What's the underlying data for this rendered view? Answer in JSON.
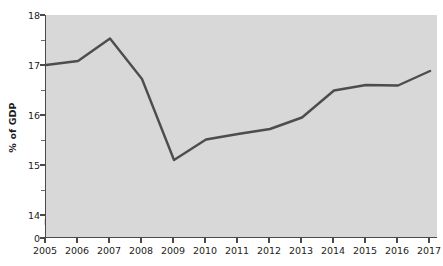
{
  "chart_data": {
    "type": "line",
    "title": "",
    "subtitle": "",
    "xlabel": "",
    "ylabel": "% of GDP",
    "categories": [
      "2005",
      "2006",
      "2007",
      "2008",
      "2009",
      "2010",
      "2011",
      "2012",
      "2013",
      "2014",
      "2015",
      "2016",
      "2017"
    ],
    "x": [
      2005,
      2006,
      2007,
      2008,
      2009,
      2010,
      2011,
      2012,
      2013,
      2014,
      2015,
      2016,
      2017
    ],
    "values": [
      17.0,
      17.08,
      17.53,
      16.72,
      15.1,
      15.51,
      15.62,
      15.72,
      15.95,
      16.49,
      16.6,
      16.59,
      16.88
    ],
    "series": [
      {
        "name": "% of GDP",
        "values": [
          17.0,
          17.08,
          17.53,
          16.72,
          15.1,
          15.51,
          15.62,
          15.72,
          15.95,
          16.49,
          16.6,
          16.59,
          16.88
        ],
        "color": "#4d4d4d"
      }
    ],
    "ylim": [
      14,
      18
    ],
    "ytick_labels": [
      "18",
      "17",
      "16",
      "15",
      "14",
      "0"
    ],
    "ytick_values": [
      18,
      17,
      16,
      15,
      14,
      0
    ],
    "y_minor_ticks": [
      17.5,
      16.5,
      15.5,
      14.5
    ],
    "axis_break": true,
    "grid": false,
    "legend": "none",
    "plot_background": "#d8d8d8",
    "axis_color": "#4a4a4a",
    "line_color": "#4d4d4d",
    "line_width": 2.4
  },
  "watermark": {
    "text": ""
  }
}
